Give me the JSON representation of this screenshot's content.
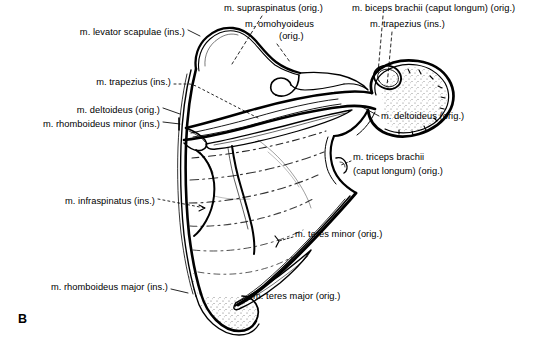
{
  "figure": {
    "panel_letter": "B",
    "width": 553,
    "height": 346,
    "background_color": "#ffffff",
    "ink_color": "#000000"
  },
  "labels": [
    {
      "id": "levator-scapulae",
      "text": "m. levator scapulae (ins.)",
      "align": "right",
      "x": 185,
      "y": 33
    },
    {
      "id": "supraspinatus",
      "text": "m. supraspinatus (orig.)",
      "align": "left",
      "x": 224,
      "y": 9
    },
    {
      "id": "omohyoideus-line1",
      "text": "m. omohyoideus",
      "align": "left",
      "x": 245,
      "y": 25
    },
    {
      "id": "omohyoideus-line2",
      "text": "(orig.)",
      "align": "left",
      "x": 279,
      "y": 37
    },
    {
      "id": "biceps-brachii",
      "text": "m. biceps brachii (caput longum) (orig.)",
      "align": "left",
      "x": 352,
      "y": 9
    },
    {
      "id": "trapezius-ins-upper",
      "text": "m. trapezius (ins.)",
      "align": "left",
      "x": 370,
      "y": 25
    },
    {
      "id": "trapezius-ins-left",
      "text": "m. trapezius (ins.)",
      "align": "right",
      "x": 171,
      "y": 83
    },
    {
      "id": "deltoideus-orig-left",
      "text": "m. deltoideus (orig.)",
      "align": "right",
      "x": 160,
      "y": 111
    },
    {
      "id": "rhomboideus-minor",
      "text": "m. rhomboideus minor (ins.)",
      "align": "right",
      "x": 160,
      "y": 125
    },
    {
      "id": "deltoideus-orig-right",
      "text": "m. deltoideus (orig.)",
      "align": "left",
      "x": 381,
      "y": 117
    },
    {
      "id": "triceps-brachii-line1",
      "text": "m. triceps brachii",
      "align": "left",
      "x": 353,
      "y": 158
    },
    {
      "id": "triceps-brachii-line2",
      "text": "(caput longum) (orig.)",
      "align": "left",
      "x": 353,
      "y": 172
    },
    {
      "id": "infraspinatus",
      "text": "m. infraspinatus (ins.)",
      "align": "right",
      "x": 155,
      "y": 202
    },
    {
      "id": "teres-minor",
      "text": "m. teres minor (orig.)",
      "align": "left",
      "x": 295,
      "y": 235
    },
    {
      "id": "rhomboideus-major",
      "text": "m. rhomboideus major (ins.)",
      "align": "right",
      "x": 168,
      "y": 288
    },
    {
      "id": "teres-major",
      "text": "m. teres major (orig.)",
      "align": "left",
      "x": 253,
      "y": 297
    }
  ]
}
